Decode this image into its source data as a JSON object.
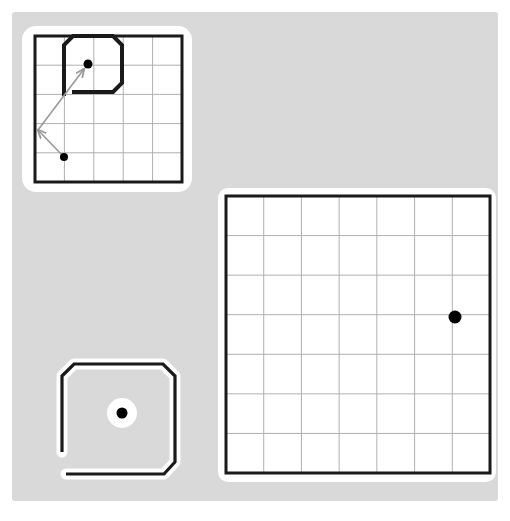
{
  "scene": {
    "title": "Grid world occupancy panels",
    "canvas": {
      "background_color": "#d9d9d9",
      "page_background_color": "#ffffff",
      "x": 12,
      "y": 12,
      "width": 486,
      "height": 489
    },
    "colors": {
      "grid_border": "#1a1a1a",
      "grid_line": "#b0b0b0",
      "obstacle_stroke": "#1a1a1a",
      "obstacle_halo": "#ffffff",
      "marker_fill": "#000000",
      "arrow_color": "#999999",
      "panel_background": "#ffffff"
    },
    "panels": [
      {
        "id": "top-left-map",
        "name": "small-grid-map-with-arrows",
        "kind": "grid-map",
        "card": {
          "x": 22,
          "y": 26,
          "width": 170,
          "height": 166,
          "radius": 14,
          "fill": "#ffffff"
        },
        "grid": {
          "x": 35,
          "y": 36,
          "width": 147,
          "height": 146,
          "cols": 5,
          "rows": 5,
          "border_width": 3,
          "line_width": 1
        },
        "obstacle": {
          "name": "octagonal-c-shape",
          "stroke_width": 4,
          "points": "64,96 64,45 73,36 113,36 122,45 122,83 113,92 72,92"
        },
        "markers": [
          {
            "name": "goal-marker",
            "x": 88,
            "y": 64,
            "r": 4.5,
            "halo": false
          },
          {
            "name": "start-marker",
            "x": 64,
            "y": 157,
            "r": 4.0,
            "halo": false
          }
        ],
        "arrows": [
          {
            "name": "arrow-to-goal",
            "x1": 38,
            "y1": 130,
            "x2": 84,
            "y2": 69
          },
          {
            "name": "arrow-from-start",
            "x1": 62,
            "y1": 155,
            "x2": 38,
            "y2": 130
          }
        ]
      },
      {
        "id": "bottom-left-shape",
        "name": "octagonal-c-obstacle-with-center-marker",
        "kind": "obstacle-outline",
        "card": null,
        "obstacle": {
          "name": "octagonal-c-shape",
          "stroke_width": 3.2,
          "halo_width": 11,
          "points": "62,452 62,376 74,364 163,364 175,376 175,462 164,474 66,474"
        },
        "markers": [
          {
            "name": "center-marker",
            "x": 122,
            "y": 413,
            "r": 5.5,
            "halo": true,
            "halo_r": 15
          }
        ],
        "arrows": []
      },
      {
        "id": "right-map",
        "name": "large-grid-map",
        "kind": "grid-map",
        "card": {
          "x": 218,
          "y": 188,
          "width": 278,
          "height": 294,
          "radius": 10,
          "fill": "#ffffff"
        },
        "grid": {
          "x": 226,
          "y": 196,
          "width": 264,
          "height": 277,
          "cols": 7,
          "rows": 7,
          "border_width": 3,
          "line_width": 1
        },
        "obstacle": null,
        "markers": [
          {
            "name": "position-marker",
            "x": 455,
            "y": 317,
            "r": 6.5,
            "halo": false
          }
        ],
        "arrows": []
      }
    ]
  }
}
